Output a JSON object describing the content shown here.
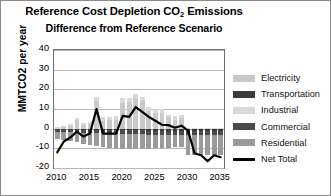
{
  "chart_data": {
    "type": "bar",
    "title": "Reference Cost Depletion CO2 Emissions",
    "subtitle": "Difference from Reference Scenario",
    "title_line1_pre": "Reference Cost Depletion CO",
    "title_line1_sub": "2",
    "title_line1_post": " Emissions",
    "xlabel": "",
    "ylabel": "MMTCO2 per year",
    "ylim": [
      -20,
      40
    ],
    "yticks": [
      40,
      30,
      20,
      10,
      0,
      -10,
      -20
    ],
    "xticks": [
      "2010",
      "2015",
      "2020",
      "2025",
      "2030",
      "2035"
    ],
    "grid": true,
    "stacked": true,
    "legend_position": "right",
    "x": [
      2010,
      2011,
      2012,
      2013,
      2014,
      2015,
      2016,
      2017,
      2018,
      2019,
      2020,
      2021,
      2022,
      2023,
      2024,
      2025,
      2026,
      2027,
      2028,
      2029,
      2030,
      2031,
      2032,
      2033,
      2034,
      2035
    ],
    "series": [
      {
        "name": "Electricity",
        "color": "#c9c9c9",
        "values": [
          0.5,
          0.8,
          1.6,
          4.2,
          2.0,
          2.4,
          14.0,
          4.0,
          4.2,
          4.6,
          13.2,
          13.4,
          15.4,
          14.0,
          9.0,
          8.2,
          8.0,
          5.8,
          4.6,
          5.2,
          0.2,
          0.2,
          0.2,
          0.2,
          0.2,
          0.2
        ]
      },
      {
        "name": "Transportation",
        "color": "#3a3a3a",
        "values": [
          -0.3,
          -0.3,
          -0.4,
          -0.4,
          -0.5,
          -0.5,
          -0.6,
          -0.6,
          -0.7,
          -0.7,
          -0.8,
          -0.8,
          -0.9,
          -0.9,
          -1.0,
          -1.0,
          -1.0,
          -1.1,
          -1.1,
          -1.1,
          -1.2,
          -1.2,
          -1.2,
          -1.3,
          -1.3,
          -1.3
        ]
      },
      {
        "name": "Industrial",
        "color": "#d9d9d9",
        "values": [
          0.4,
          0.5,
          0.8,
          1.4,
          1.0,
          1.2,
          2.2,
          2.0,
          1.8,
          1.6,
          2.2,
          2.4,
          2.2,
          2.2,
          2.0,
          1.8,
          1.8,
          1.4,
          1.6,
          1.6,
          0.2,
          0.2,
          0.2,
          0.2,
          0.2,
          0.2
        ]
      },
      {
        "name": "Commercial",
        "color": "#4a4a4a",
        "values": [
          -1.2,
          -1.3,
          -1.4,
          -1.5,
          -1.5,
          -1.6,
          -1.7,
          -1.7,
          -1.8,
          -1.8,
          -1.9,
          -1.9,
          -2.0,
          -2.0,
          -2.0,
          -2.0,
          -2.0,
          -2.0,
          -2.0,
          -2.0,
          -2.1,
          -2.1,
          -2.1,
          -2.1,
          -2.1,
          -2.1
        ]
      },
      {
        "name": "Residential",
        "color": "#9a9a9a",
        "values": [
          -4.0,
          -4.2,
          -4.6,
          -5.0,
          -5.6,
          -6.2,
          -6.6,
          -7.0,
          -7.4,
          -7.6,
          -7.8,
          -7.8,
          -7.6,
          -7.4,
          -7.2,
          -7.0,
          -6.8,
          -6.6,
          -6.4,
          -6.2,
          -10.0,
          -10.0,
          -10.0,
          -10.0,
          -10.0,
          -10.0
        ]
      }
    ],
    "net_total": {
      "name": "Net Total",
      "color": "#000000",
      "values": [
        -12.0,
        -6.5,
        -4.5,
        -1.5,
        -4.0,
        -2.5,
        10.0,
        -2.5,
        -2.5,
        -2.5,
        6.5,
        6.0,
        11.0,
        8.5,
        6.0,
        4.0,
        2.0,
        1.8,
        0.5,
        1.5,
        -1.0,
        -12.5,
        -13.5,
        -16.5,
        -13.5,
        -14.5
      ]
    }
  },
  "legend": {
    "items": [
      {
        "label": "Electricity",
        "color": "#c9c9c9",
        "kind": "swatch"
      },
      {
        "label": "Transportation",
        "color": "#3a3a3a",
        "kind": "swatch"
      },
      {
        "label": "Industrial",
        "color": "#d9d9d9",
        "kind": "swatch"
      },
      {
        "label": "Commercial",
        "color": "#4a4a4a",
        "kind": "swatch"
      },
      {
        "label": "Residential",
        "color": "#9a9a9a",
        "kind": "swatch"
      },
      {
        "label": "Net Total",
        "color": "#000000",
        "kind": "line"
      }
    ]
  }
}
